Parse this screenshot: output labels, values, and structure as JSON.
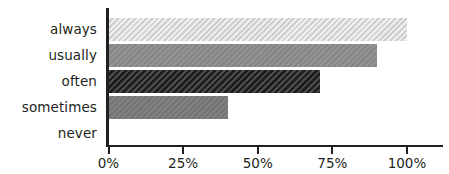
{
  "chart_data": {
    "type": "bar",
    "orientation": "horizontal",
    "title": "",
    "subtitle": "",
    "xlabel": "",
    "ylabel": "",
    "categories": [
      "always",
      "usually",
      "often",
      "sometimes",
      "never"
    ],
    "values": [
      100,
      90,
      71,
      40,
      0
    ],
    "value_unit": "%",
    "xlim": [
      0,
      100
    ],
    "xticks": [
      0,
      25,
      50,
      75,
      100
    ],
    "xtick_labels": [
      "0%",
      "25%",
      "50%",
      "75%",
      "100%"
    ],
    "grid": false,
    "legend": false,
    "legend_position": "none",
    "series": [
      {
        "name": "response share",
        "values": [
          100,
          90,
          71,
          40,
          0
        ]
      }
    ],
    "bar_colors": [
      "#dcdcdc",
      "#8d8d8d",
      "#2b2b2b",
      "#7a7a7a",
      "#7a7a7a"
    ],
    "axis_color": "#231f20",
    "background": "#ffffff",
    "annotations": []
  },
  "axis": {
    "tick_labels": [
      "0%",
      "25%",
      "50%",
      "75%",
      "100%"
    ],
    "category_labels": [
      "always",
      "usually",
      "often",
      "sometimes",
      "never"
    ]
  }
}
